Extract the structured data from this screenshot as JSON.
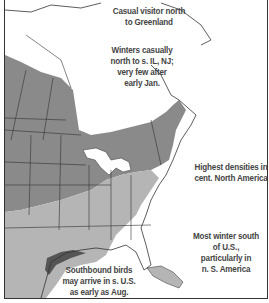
{
  "map": {
    "title": "Winter and migration range map",
    "colors": {
      "high_density": "#8a8a8a",
      "range": "#b5b5b5",
      "coast_band": "#555555",
      "land": "#ffffff",
      "borders": "#333333"
    },
    "annotations": [
      {
        "id": "greenland",
        "text_lines": [
          "Casual visitor north",
          "to Greenland"
        ]
      },
      {
        "id": "winter-casual",
        "text_lines": [
          "Winters casually",
          "north to s. IL, NJ;",
          "very few after",
          "early Jan."
        ]
      },
      {
        "id": "highest-densities",
        "text_lines": [
          "Highest densities in",
          "cent. North America"
        ]
      },
      {
        "id": "most-winter",
        "text_lines": [
          "Most winter south",
          "of U.S.,",
          "particularly in",
          "n. S. America"
        ]
      },
      {
        "id": "southbound",
        "text_lines": [
          "Southbound birds",
          "may arrive in s. U.S.",
          "as early as Aug."
        ]
      }
    ]
  }
}
